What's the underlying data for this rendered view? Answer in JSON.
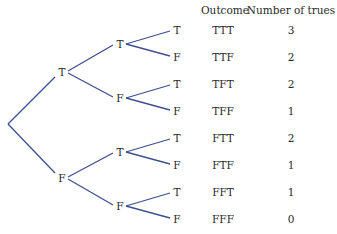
{
  "headers": {
    "outcome": "Outcome",
    "count": "Number of trues"
  },
  "line_color": "#3e4f8f",
  "level1": [
    {
      "label": "T",
      "x": 62,
      "y": 72
    },
    {
      "label": "F",
      "x": 62,
      "y": 178
    }
  ],
  "level2": [
    {
      "label": "T",
      "x": 120,
      "y": 44
    },
    {
      "label": "F",
      "x": 120,
      "y": 98
    },
    {
      "label": "T",
      "x": 120,
      "y": 152
    },
    {
      "label": "F",
      "x": 120,
      "y": 206
    }
  ],
  "leaves": [
    {
      "label": "T",
      "outcome": "TTT",
      "count": "3",
      "y": 30
    },
    {
      "label": "F",
      "outcome": "TTF",
      "count": "2",
      "y": 57
    },
    {
      "label": "T",
      "outcome": "TFT",
      "count": "2",
      "y": 84
    },
    {
      "label": "F",
      "outcome": "TFF",
      "count": "1",
      "y": 111
    },
    {
      "label": "T",
      "outcome": "FTT",
      "count": "2",
      "y": 138
    },
    {
      "label": "F",
      "outcome": "FTF",
      "count": "1",
      "y": 165
    },
    {
      "label": "T",
      "outcome": "FFT",
      "count": "1",
      "y": 192
    },
    {
      "label": "F",
      "outcome": "FFF",
      "count": "0",
      "y": 219
    }
  ]
}
